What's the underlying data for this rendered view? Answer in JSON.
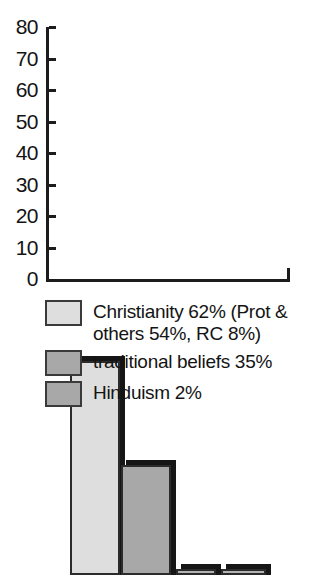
{
  "chart_data": {
    "type": "bar",
    "title": "",
    "subtitle": "",
    "xlabel": "",
    "ylabel": "",
    "ylim": [
      0,
      80
    ],
    "grid": false,
    "legend_position": "bottom",
    "categories": [
      "Christianity",
      "traditional beliefs",
      "Hinduism",
      "other"
    ],
    "values": [
      68,
      35,
      2,
      2
    ],
    "series": [
      {
        "name": "religious affiliation",
        "values": [
          68,
          35,
          2,
          2
        ]
      }
    ],
    "y_ticks": [
      {
        "value": 80,
        "label": "80"
      },
      {
        "value": 70,
        "label": "70"
      },
      {
        "value": 60,
        "label": "60"
      },
      {
        "value": 50,
        "label": "50"
      },
      {
        "value": 40,
        "label": "40"
      },
      {
        "value": 30,
        "label": "30"
      },
      {
        "value": 20,
        "label": "20"
      },
      {
        "value": 10,
        "label": "10"
      },
      {
        "value": 0,
        "label": "0"
      }
    ],
    "bars": [
      {
        "name": "bar-christianity",
        "value": 68,
        "fill": "#dedede",
        "left": 70,
        "width": 50
      },
      {
        "name": "bar-traditional-beliefs",
        "value": 35,
        "fill": "#a8a8a8",
        "left": 121,
        "width": 50
      },
      {
        "name": "bar-hinduism",
        "value": 2,
        "fill": "#b3b3b3",
        "left": 176,
        "width": 40
      },
      {
        "name": "bar-other",
        "value": 2,
        "fill": "#b3b3b3",
        "left": 221,
        "width": 45
      }
    ],
    "legend": [
      {
        "label": "Christianity 62% (Prot &\nothers 54%, RC 8%)",
        "color": "#dedede"
      },
      {
        "label": "traditional beliefs 35%",
        "color": "#a8a8a8"
      },
      {
        "label": "Hinduism 2%",
        "color": "#a8a8a8"
      }
    ],
    "colors": {
      "axis": "#1c1c1c",
      "shadow": "#161616",
      "outline": "#2b2b2b",
      "background": "#ffffff",
      "text": "#141414"
    }
  }
}
